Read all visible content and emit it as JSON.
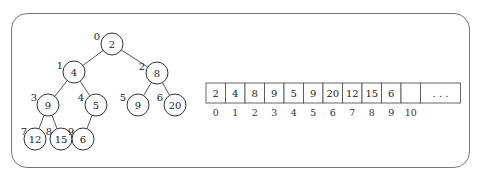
{
  "diagram": {
    "tree": {
      "nodes": [
        {
          "index": "0",
          "value": "2",
          "cx": 112,
          "cy": 44,
          "lx": 97,
          "ly": 40
        },
        {
          "index": "1",
          "value": "4",
          "cx": 74,
          "cy": 72,
          "lx": 60,
          "ly": 69
        },
        {
          "index": "2",
          "value": "8",
          "cx": 157,
          "cy": 73,
          "lx": 142,
          "ly": 70
        },
        {
          "index": "3",
          "value": "9",
          "cx": 48,
          "cy": 105,
          "lx": 34,
          "ly": 101
        },
        {
          "index": "4",
          "value": "5",
          "cx": 96,
          "cy": 105,
          "lx": 81,
          "ly": 101
        },
        {
          "index": "5",
          "value": "9",
          "cx": 138,
          "cy": 105,
          "lx": 123,
          "ly": 101
        },
        {
          "index": "6",
          "value": "20",
          "cx": 175,
          "cy": 105,
          "lx": 160,
          "ly": 101
        },
        {
          "index": "7",
          "value": "12",
          "cx": 35,
          "cy": 139,
          "lx": 24,
          "ly": 135
        },
        {
          "index": "8",
          "value": "15",
          "cx": 61,
          "cy": 139,
          "lx": 49,
          "ly": 135
        },
        {
          "index": "9",
          "value": "6",
          "cx": 83,
          "cy": 139,
          "lx": 71,
          "ly": 135
        }
      ],
      "edges": [
        [
          0,
          1
        ],
        [
          0,
          2
        ],
        [
          1,
          3
        ],
        [
          1,
          4
        ],
        [
          2,
          5
        ],
        [
          2,
          6
        ],
        [
          3,
          7
        ],
        [
          3,
          8
        ],
        [
          4,
          9
        ]
      ]
    },
    "array": {
      "cells": [
        "2",
        "4",
        "8",
        "9",
        "5",
        "9",
        "20",
        "12",
        "15",
        "6",
        "",
        ". . ."
      ],
      "indices": [
        "0",
        "1",
        "2",
        "3",
        "4",
        "5",
        "6",
        "7",
        "8",
        "9",
        "10"
      ]
    }
  }
}
